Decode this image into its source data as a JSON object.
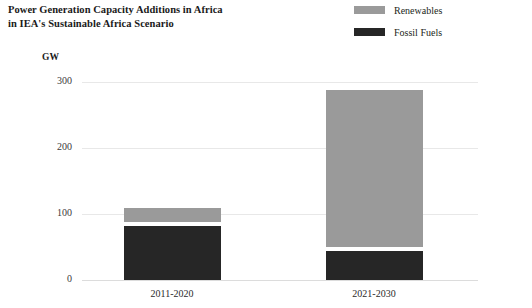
{
  "title": {
    "line1": "Power Generation Capacity Additions in Africa",
    "line2": "in IEA's Sustainable Africa Scenario"
  },
  "legend": {
    "position": "top-right",
    "items": [
      {
        "label": "Renewables",
        "color": "#9a9a9a"
      },
      {
        "label": "Fossil Fuels",
        "color": "#262626"
      }
    ]
  },
  "axis": {
    "y_unit": "GW",
    "y_ticks": [
      "0",
      "100",
      "200",
      "300"
    ]
  },
  "chart_data": {
    "type": "bar",
    "title": "Power Generation Capacity Additions in Africa in IEA's Sustainable Africa Scenario",
    "subtitle": "",
    "xlabel": "",
    "ylabel": "GW",
    "ylim": [
      0,
      320
    ],
    "yticks": [
      0,
      100,
      200,
      300
    ],
    "grid": true,
    "stacked": true,
    "legend_position": "top-right",
    "categories": [
      "2011-2020",
      "2021-2030"
    ],
    "series": [
      {
        "name": "Fossil Fuels",
        "color": "#262626",
        "values": [
          82,
          44
        ]
      },
      {
        "name": "Renewables",
        "color": "#9a9a9a",
        "values": [
          27,
          244
        ]
      }
    ],
    "totals": [
      109,
      288
    ]
  }
}
